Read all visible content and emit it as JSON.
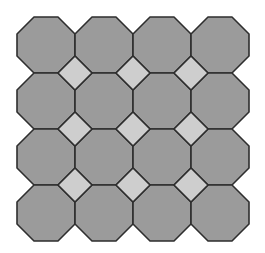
{
  "diagram": {
    "type": "truncated-square-tiling",
    "grid": {
      "rows": 4,
      "cols": 4
    },
    "origin": {
      "x": 17,
      "y": 17
    },
    "cell": {
      "width": 58,
      "height": 56
    },
    "corner_cut": 17,
    "colors": {
      "background": "#ffffff",
      "octagon_fill": "#9b9b9b",
      "square_fill": "#cecece",
      "stroke": "#2e2e2e"
    },
    "stroke_width": 1.6,
    "shapes": {
      "octagons": 16,
      "squares": 9
    }
  }
}
